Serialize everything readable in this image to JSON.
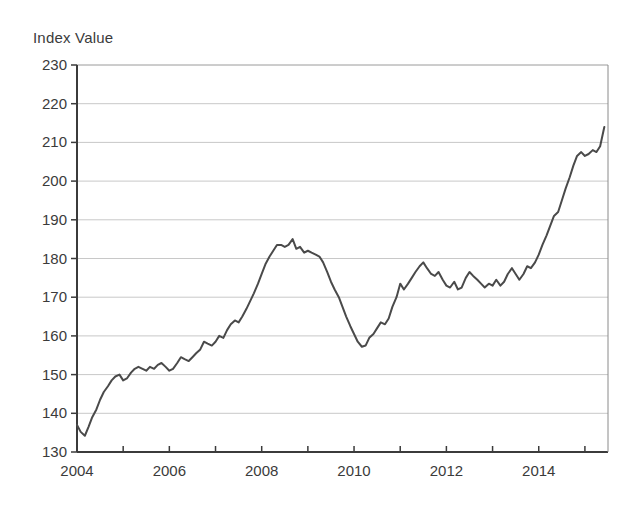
{
  "chart_data": {
    "type": "line",
    "title": "",
    "ylabel": "Index Value",
    "xlabel": "",
    "ylim": [
      130,
      230
    ],
    "xlim": [
      2004.0,
      2015.5
    ],
    "ytick_step": 10,
    "yticks": [
      130,
      140,
      150,
      160,
      170,
      180,
      190,
      200,
      210,
      220,
      230
    ],
    "xticks": [
      2004,
      2005,
      2006,
      2007,
      2008,
      2009,
      2010,
      2011,
      2012,
      2013,
      2014,
      2015
    ],
    "xtick_labels_shown": [
      "2004",
      "2006",
      "2008",
      "2010",
      "2012",
      "2014"
    ],
    "grid": "horizontal",
    "legend": "none",
    "line_color": "#4a4a4a",
    "line_width": 2.0,
    "series": [
      {
        "name": "Index Value",
        "x": [
          2004.0,
          2004.08,
          2004.17,
          2004.25,
          2004.33,
          2004.42,
          2004.5,
          2004.58,
          2004.67,
          2004.75,
          2004.83,
          2004.92,
          2005.0,
          2005.08,
          2005.17,
          2005.25,
          2005.33,
          2005.42,
          2005.5,
          2005.58,
          2005.67,
          2005.75,
          2005.83,
          2005.92,
          2006.0,
          2006.08,
          2006.17,
          2006.25,
          2006.33,
          2006.42,
          2006.5,
          2006.58,
          2006.67,
          2006.75,
          2006.83,
          2006.92,
          2007.0,
          2007.08,
          2007.17,
          2007.25,
          2007.33,
          2007.42,
          2007.5,
          2007.58,
          2007.67,
          2007.75,
          2007.83,
          2007.92,
          2008.0,
          2008.08,
          2008.17,
          2008.25,
          2008.33,
          2008.42,
          2008.5,
          2008.58,
          2008.67,
          2008.75,
          2008.83,
          2008.92,
          2009.0,
          2009.08,
          2009.17,
          2009.25,
          2009.33,
          2009.42,
          2009.5,
          2009.58,
          2009.67,
          2009.75,
          2009.83,
          2009.92,
          2010.0,
          2010.08,
          2010.17,
          2010.25,
          2010.33,
          2010.42,
          2010.5,
          2010.58,
          2010.67,
          2010.75,
          2010.83,
          2010.92,
          2011.0,
          2011.08,
          2011.17,
          2011.25,
          2011.33,
          2011.42,
          2011.5,
          2011.58,
          2011.67,
          2011.75,
          2011.83,
          2011.92,
          2012.0,
          2012.08,
          2012.17,
          2012.25,
          2012.33,
          2012.42,
          2012.5,
          2012.58,
          2012.67,
          2012.75,
          2012.83,
          2012.92,
          2013.0,
          2013.08,
          2013.17,
          2013.25,
          2013.33,
          2013.42,
          2013.5,
          2013.58,
          2013.67,
          2013.75,
          2013.83,
          2013.92,
          2014.0,
          2014.08,
          2014.17,
          2014.25,
          2014.33,
          2014.42,
          2014.5,
          2014.58,
          2014.67,
          2014.75,
          2014.83,
          2014.92,
          2015.0,
          2015.08,
          2015.17,
          2015.25,
          2015.33,
          2015.42
        ],
        "values": [
          137.0,
          135.2,
          134.2,
          136.5,
          139.0,
          141.0,
          143.5,
          145.5,
          147.0,
          148.5,
          149.5,
          150.0,
          148.5,
          149.0,
          150.5,
          151.5,
          152.0,
          151.5,
          151.0,
          152.0,
          151.5,
          152.5,
          153.0,
          152.0,
          151.0,
          151.5,
          153.0,
          154.5,
          154.0,
          153.5,
          154.5,
          155.5,
          156.5,
          158.5,
          158.0,
          157.5,
          158.5,
          160.0,
          159.5,
          161.5,
          163.0,
          164.0,
          163.5,
          165.0,
          167.0,
          169.0,
          171.0,
          173.5,
          176.0,
          178.5,
          180.5,
          182.0,
          183.5,
          183.5,
          183.0,
          183.5,
          185.0,
          182.5,
          183.0,
          181.5,
          182.0,
          181.5,
          181.0,
          180.5,
          179.0,
          176.5,
          174.0,
          172.0,
          170.0,
          167.5,
          165.0,
          162.5,
          160.5,
          158.5,
          157.2,
          157.5,
          159.5,
          160.5,
          162.0,
          163.5,
          163.0,
          164.5,
          167.5,
          170.0,
          173.5,
          172.0,
          173.5,
          175.0,
          176.5,
          178.0,
          179.0,
          177.5,
          176.0,
          175.5,
          176.5,
          174.5,
          173.0,
          172.5,
          174.0,
          172.0,
          172.5,
          175.0,
          176.5,
          175.5,
          174.5,
          173.5,
          172.5,
          173.5,
          173.0,
          174.5,
          173.0,
          174.0,
          176.0,
          177.5,
          176.0,
          174.5,
          176.0,
          178.0,
          177.5,
          179.0,
          181.0,
          183.5,
          186.0,
          188.5,
          191.0,
          192.0,
          195.0,
          198.0,
          201.0,
          204.0,
          206.5,
          207.5,
          206.5,
          207.0,
          208.0,
          207.5,
          209.0,
          214.0
        ]
      }
    ],
    "annotations": {
      "start_value": 137.0,
      "min_value": 134.2,
      "max_value": 220.0,
      "end_value": 220.0,
      "pre_crisis_peak": 185.0,
      "crisis_trough": 157.2
    }
  },
  "axis": {
    "y_title": "Index Value",
    "y_labels": [
      "230",
      "220",
      "210",
      "200",
      "190",
      "180",
      "170",
      "160",
      "150",
      "140",
      "130"
    ],
    "x_labels": [
      "2004",
      "2006",
      "2008",
      "2010",
      "2012",
      "2014"
    ]
  }
}
